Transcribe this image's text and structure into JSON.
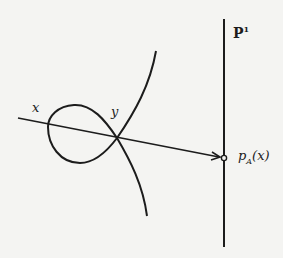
{
  "diagram": {
    "labels": {
      "x_point": "x",
      "y_point": "y",
      "projective_line": "P",
      "projective_line_sup": "1",
      "projection_base": "p",
      "projection_sub": "A",
      "projection_arg": "(x)"
    },
    "colors": {
      "ink": "#1c1c1c",
      "background": "#f4f4f2"
    }
  }
}
